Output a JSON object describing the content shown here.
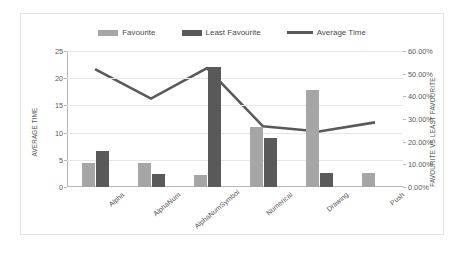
{
  "legend": [
    {
      "label": "Favourite",
      "type": "swatch",
      "color": "#a6a6a6"
    },
    {
      "label": "Least Favourite",
      "type": "swatch",
      "color": "#595959"
    },
    {
      "label": "Average Time",
      "type": "line",
      "color": "#595959"
    }
  ],
  "axes": {
    "left_title": "AVERAGE TIME",
    "right_title": "FAVOURITE VS LEAST FAVOURITE",
    "left_ticks": [
      "0",
      "5",
      "10",
      "15",
      "20",
      "25"
    ],
    "right_ticks": [
      "0.00%",
      "10.00%",
      "20.00%",
      "30.00%",
      "40.00%",
      "50.00%",
      "60.00%"
    ]
  },
  "chart_data": {
    "type": "bar",
    "title": "",
    "xlabel": "",
    "ylabel": "AVERAGE TIME",
    "y2label": "FAVOURITE VS LEAST FAVOURITE",
    "categories": [
      "Alpha",
      "AlphaNum",
      "AlphaNumSymbol",
      "Numerical",
      "Drawing",
      "Push"
    ],
    "ylim": [
      0,
      25
    ],
    "y2lim": [
      0,
      0.6
    ],
    "grid": true,
    "legend_position": "top",
    "series": [
      {
        "name": "Favourite",
        "type": "bar",
        "axis": "left",
        "color": "#a6a6a6",
        "values": [
          4.4,
          4.5,
          2.3,
          11.1,
          17.8,
          2.6
        ]
      },
      {
        "name": "Least Favourite",
        "type": "bar",
        "axis": "left",
        "color": "#595959",
        "values": [
          6.6,
          2.4,
          22.0,
          9.0,
          2.6,
          0
        ]
      },
      {
        "name": "Average Time",
        "type": "line",
        "axis": "right",
        "color": "#595959",
        "values": [
          0.52,
          0.39,
          0.525,
          0.268,
          0.245,
          0.285
        ]
      }
    ]
  }
}
